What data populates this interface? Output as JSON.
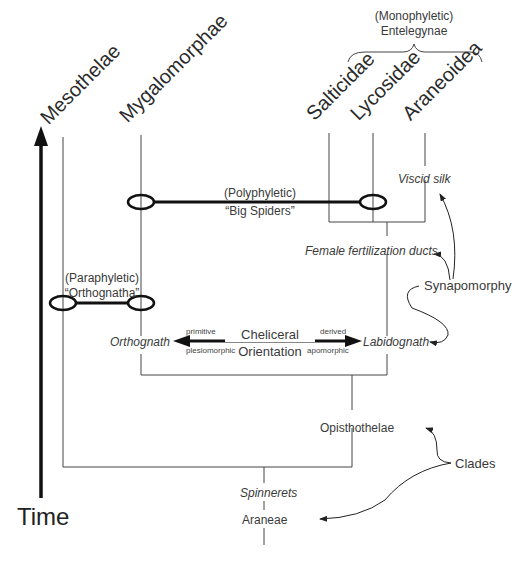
{
  "taxa": {
    "mesothelae": "Mesothelae",
    "mygalomorphae": "Mygalomorphae",
    "salticidae": "Salticidae",
    "lycosidae": "Lycosidae",
    "araneoidea": "Araneoidea"
  },
  "groups": {
    "entelegynae": {
      "qualifier": "(Monophyletic)",
      "name": "Entelegynae"
    },
    "big_spiders": {
      "qualifier": "(Polyphyletic)",
      "name": "“Big Spiders”"
    },
    "orthognatha": {
      "qualifier": "(Paraphyletic)",
      "name": "“Orthognatha”"
    }
  },
  "characters": {
    "viscid_silk": "Viscid silk",
    "female_ducts": "Female fertilization ducts",
    "orthognath": "Orthognath",
    "labidognath": "Labidognath",
    "spinnerets": "Spinnerets"
  },
  "cheliceral_axis": {
    "title_line1": "Cheliceral",
    "title_line2": "Orientation",
    "left_top": "primitive",
    "left_bottom": "plesiomorphic",
    "right_top": "derived",
    "right_bottom": "apomorphic"
  },
  "clades": {
    "opisthothelae": "Opisthothelae",
    "araneae": "Araneae"
  },
  "annotations": {
    "synapomorphy": "Synapomorphy",
    "clades": "Clades"
  },
  "axis": {
    "time_label": "Time"
  }
}
